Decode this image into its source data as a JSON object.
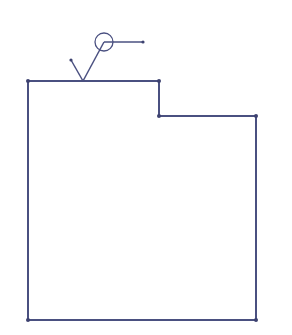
{
  "diagram": {
    "type": "floor-plan-outline",
    "stroke_color": "#4a5080",
    "stroke_width": 2,
    "vertex_color": "#3d4270",
    "outline": {
      "points": [
        [
          28,
          81
        ],
        [
          159,
          81
        ],
        [
          159,
          116
        ],
        [
          256,
          116
        ],
        [
          256,
          320
        ],
        [
          28,
          320
        ]
      ]
    },
    "vertices": [
      [
        28,
        81
      ],
      [
        159,
        81
      ],
      [
        159,
        116
      ],
      [
        256,
        116
      ],
      [
        256,
        320
      ],
      [
        28,
        320
      ]
    ],
    "marker": {
      "v_left_tip": [
        71,
        60
      ],
      "v_vertex": [
        83,
        81
      ],
      "circle_center": [
        104,
        42
      ],
      "circle_radius": 9,
      "leader_end": [
        143,
        42
      ]
    }
  }
}
